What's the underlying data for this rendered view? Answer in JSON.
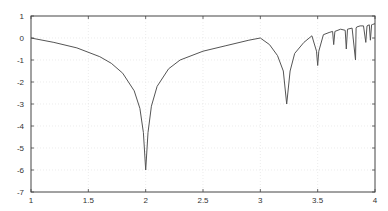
{
  "chart_data": {
    "type": "line",
    "title": "",
    "xlabel": "",
    "ylabel": "",
    "xlim": [
      1,
      4
    ],
    "ylim": [
      -7,
      1
    ],
    "grid": true,
    "legend": null,
    "x_ticks": [
      1,
      1.5,
      2,
      2.5,
      3,
      3.5,
      4
    ],
    "x_tick_labels": [
      "1",
      "1.5",
      "2",
      "2.5",
      "3",
      "3.5",
      "4"
    ],
    "y_ticks": [
      1,
      0,
      -1,
      -2,
      -3,
      -4,
      -5,
      -6,
      -7
    ],
    "y_tick_labels": [
      "1",
      "0",
      "-1",
      "-2",
      "-3",
      "-4",
      "-5",
      "-6",
      "-7"
    ],
    "line_color": "#555555",
    "series": [
      {
        "name": "curve",
        "x": [
          1.0,
          1.2,
          1.4,
          1.6,
          1.7,
          1.8,
          1.9,
          1.95,
          1.98,
          2.0,
          2.02,
          2.05,
          2.1,
          2.2,
          2.3,
          2.5,
          2.7,
          2.9,
          3.0,
          3.08,
          3.15,
          3.2,
          3.23,
          3.26,
          3.3,
          3.38,
          3.45,
          3.49,
          3.5,
          3.51,
          3.55,
          3.6,
          3.63,
          3.64,
          3.65,
          3.7,
          3.74,
          3.75,
          3.76,
          3.8,
          3.83,
          3.835,
          3.84,
          3.87,
          3.9,
          3.92,
          3.93,
          3.95,
          3.96,
          3.97,
          3.98,
          4.0
        ],
        "y": [
          0.0,
          -0.2,
          -0.45,
          -0.85,
          -1.15,
          -1.6,
          -2.4,
          -3.2,
          -4.3,
          -6.0,
          -4.3,
          -3.1,
          -2.2,
          -1.4,
          -1.0,
          -0.6,
          -0.35,
          -0.1,
          0.0,
          -0.3,
          -0.8,
          -1.5,
          -3.0,
          -1.5,
          -0.7,
          -0.2,
          0.1,
          -0.6,
          -1.25,
          -0.6,
          0.15,
          0.25,
          0.3,
          -0.3,
          0.3,
          0.4,
          0.35,
          -0.5,
          0.4,
          0.45,
          -1.0,
          0.45,
          0.5,
          0.55,
          0.55,
          -0.2,
          0.55,
          0.6,
          -0.1,
          0.6,
          0.62,
          0.65
        ]
      }
    ]
  }
}
